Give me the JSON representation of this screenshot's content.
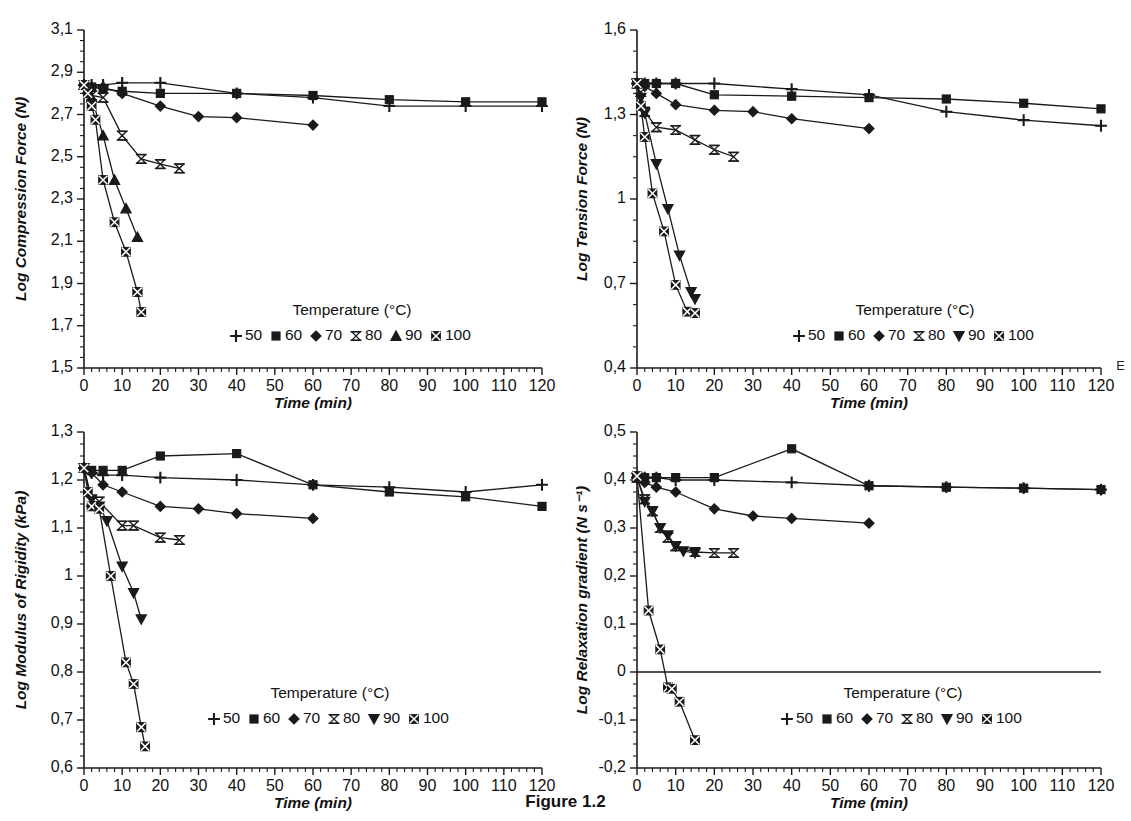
{
  "figure": {
    "caption": "Figure 1.2",
    "edge_artifact": "E"
  },
  "legend": {
    "title": "Temperature (°C)",
    "entries": [
      {
        "label": "50",
        "marker": "plus"
      },
      {
        "label": "60",
        "marker": "square-filled"
      },
      {
        "label": "70",
        "marker": "diamond-filled"
      },
      {
        "label": "80",
        "marker": "bowtie-open"
      },
      {
        "label": "90",
        "marker": "triangle-up-filled"
      },
      {
        "label": "100",
        "marker": "square-crossed"
      }
    ],
    "entries_alt": [
      {
        "label": "50",
        "marker": "plus"
      },
      {
        "label": "60",
        "marker": "square-filled"
      },
      {
        "label": "70",
        "marker": "diamond-filled"
      },
      {
        "label": "80",
        "marker": "bowtie-open"
      },
      {
        "label": "90",
        "marker": "triangle-down-filled"
      },
      {
        "label": "100",
        "marker": "square-crossed"
      }
    ]
  },
  "chart_data": [
    {
      "id": "compression",
      "type": "line",
      "title": "",
      "xlabel": "Time (min)",
      "ylabel": "Log Compression Force (N)",
      "xlim": [
        0,
        120
      ],
      "ylim": [
        1.5,
        3.1
      ],
      "xticks": [
        0,
        10,
        20,
        30,
        40,
        50,
        60,
        70,
        80,
        90,
        100,
        110,
        120
      ],
      "yticks": [
        1.5,
        1.7,
        1.9,
        2.1,
        2.3,
        2.5,
        2.7,
        2.9,
        3.1
      ],
      "ytick_labels": [
        "1,5",
        "1,7",
        "1,9",
        "2,1",
        "2,3",
        "2,5",
        "2,7",
        "2,9",
        "3,1"
      ],
      "xtick_labels": [
        "0",
        "10",
        "20",
        "30",
        "40",
        "50",
        "60",
        "70",
        "80",
        "90",
        "100",
        "110",
        "120"
      ],
      "grid": false,
      "legend_position": "bottom-right",
      "series": [
        {
          "name": "50",
          "marker": "plus",
          "x": [
            0,
            2,
            5,
            10,
            20,
            40,
            60,
            80,
            100,
            120
          ],
          "y": [
            2.84,
            2.84,
            2.84,
            2.85,
            2.85,
            2.8,
            2.78,
            2.74,
            2.74,
            2.74
          ]
        },
        {
          "name": "60",
          "marker": "square-filled",
          "x": [
            0,
            2,
            5,
            10,
            20,
            40,
            60,
            80,
            100,
            120
          ],
          "y": [
            2.84,
            2.83,
            2.82,
            2.81,
            2.8,
            2.8,
            2.79,
            2.77,
            2.76,
            2.76
          ]
        },
        {
          "name": "70",
          "marker": "diamond-filled",
          "x": [
            0,
            2,
            5,
            10,
            20,
            30,
            40,
            60
          ],
          "y": [
            2.84,
            2.83,
            2.83,
            2.8,
            2.74,
            2.69,
            2.685,
            2.65
          ]
        },
        {
          "name": "80",
          "marker": "bowtie-open",
          "x": [
            0,
            1,
            2,
            5,
            10,
            15,
            20,
            25
          ],
          "y": [
            2.84,
            2.82,
            2.79,
            2.78,
            2.6,
            2.49,
            2.465,
            2.445
          ]
        },
        {
          "name": "90",
          "marker": "triangle-up-filled",
          "x": [
            0,
            1,
            2,
            5,
            8,
            11,
            14
          ],
          "y": [
            2.84,
            2.82,
            2.78,
            2.6,
            2.39,
            2.255,
            2.12
          ]
        },
        {
          "name": "100",
          "marker": "square-crossed",
          "x": [
            0,
            1,
            2,
            3,
            5,
            8,
            11,
            14
          ],
          "y": [
            2.84,
            2.8,
            2.74,
            2.675,
            2.39,
            2.19,
            2.05,
            1.86
          ]
        },
        {
          "name": "100b",
          "marker": "square-crossed",
          "x": [
            14,
            15
          ],
          "y": [
            1.86,
            1.765
          ]
        }
      ]
    },
    {
      "id": "tension",
      "type": "line",
      "title": "",
      "xlabel": "Time (min)",
      "ylabel": "Log Tension Force (N)",
      "xlim": [
        0,
        120
      ],
      "ylim": [
        0.4,
        1.6
      ],
      "xticks": [
        0,
        10,
        20,
        30,
        40,
        50,
        60,
        70,
        80,
        90,
        100,
        110,
        120
      ],
      "yticks": [
        0.4,
        0.7,
        1.0,
        1.3,
        1.6
      ],
      "ytick_labels": [
        "0,4",
        "0,7",
        "1",
        "1,3",
        "1,6"
      ],
      "xtick_labels": [
        "0",
        "10",
        "20",
        "30",
        "40",
        "50",
        "60",
        "70",
        "80",
        "90",
        "100",
        "110",
        "120"
      ],
      "grid": false,
      "legend_position": "bottom-right",
      "series": [
        {
          "name": "50",
          "marker": "plus",
          "x": [
            0,
            2,
            5,
            10,
            20,
            40,
            60,
            80,
            100,
            120
          ],
          "y": [
            1.41,
            1.41,
            1.41,
            1.41,
            1.41,
            1.39,
            1.37,
            1.31,
            1.28,
            1.26
          ]
        },
        {
          "name": "60",
          "marker": "square-filled",
          "x": [
            0,
            2,
            5,
            10,
            20,
            40,
            60,
            80,
            100,
            120
          ],
          "y": [
            1.41,
            1.41,
            1.41,
            1.41,
            1.37,
            1.365,
            1.36,
            1.355,
            1.34,
            1.32
          ]
        },
        {
          "name": "70",
          "marker": "diamond-filled",
          "x": [
            0,
            2,
            5,
            10,
            20,
            30,
            40,
            60
          ],
          "y": [
            1.41,
            1.4,
            1.375,
            1.335,
            1.315,
            1.31,
            1.285,
            1.25
          ]
        },
        {
          "name": "80",
          "marker": "bowtie-open",
          "x": [
            0,
            1,
            2,
            5,
            10,
            15,
            20,
            25
          ],
          "y": [
            1.41,
            1.38,
            1.31,
            1.255,
            1.245,
            1.21,
            1.175,
            1.15
          ]
        },
        {
          "name": "90",
          "marker": "triangle-down-filled",
          "x": [
            0,
            1,
            2,
            5,
            8,
            11,
            14,
            15
          ],
          "y": [
            1.41,
            1.36,
            1.305,
            1.125,
            0.965,
            0.8,
            0.67,
            0.645
          ]
        },
        {
          "name": "100",
          "marker": "square-crossed",
          "x": [
            0,
            1,
            2,
            4,
            7,
            10,
            13,
            15
          ],
          "y": [
            1.41,
            1.33,
            1.22,
            1.02,
            0.885,
            0.695,
            0.6,
            0.595
          ]
        }
      ]
    },
    {
      "id": "rigidity",
      "type": "line",
      "title": "",
      "xlabel": "Time (min)",
      "ylabel": "Log Modulus of Rigidity (kPa)",
      "xlim": [
        0,
        120
      ],
      "ylim": [
        0.6,
        1.3
      ],
      "xticks": [
        0,
        10,
        20,
        30,
        40,
        50,
        60,
        70,
        80,
        90,
        100,
        110,
        120
      ],
      "yticks": [
        0.6,
        0.7,
        0.8,
        0.9,
        1.0,
        1.1,
        1.2,
        1.3
      ],
      "ytick_labels": [
        "0,6",
        "0,7",
        "0,8",
        "0,9",
        "1",
        "1,1",
        "1,2",
        "1,3"
      ],
      "xtick_labels": [
        "0",
        "10",
        "20",
        "30",
        "40",
        "50",
        "60",
        "70",
        "80",
        "90",
        "100",
        "110",
        "120"
      ],
      "grid": false,
      "legend_position": "bottom-right",
      "series": [
        {
          "name": "50",
          "marker": "plus",
          "x": [
            0,
            2,
            5,
            10,
            20,
            40,
            60,
            80,
            100,
            120
          ],
          "y": [
            1.225,
            1.215,
            1.21,
            1.21,
            1.205,
            1.2,
            1.19,
            1.185,
            1.175,
            1.19
          ]
        },
        {
          "name": "60",
          "marker": "square-filled",
          "x": [
            0,
            2,
            5,
            10,
            20,
            40,
            60,
            80,
            100,
            120
          ],
          "y": [
            1.225,
            1.22,
            1.22,
            1.22,
            1.25,
            1.255,
            1.19,
            1.175,
            1.165,
            1.145
          ]
        },
        {
          "name": "70",
          "marker": "diamond-filled",
          "x": [
            0,
            2,
            5,
            10,
            20,
            30,
            40,
            60
          ],
          "y": [
            1.225,
            1.215,
            1.19,
            1.175,
            1.145,
            1.14,
            1.13,
            1.12
          ]
        },
        {
          "name": "80",
          "marker": "bowtie-open",
          "x": [
            0,
            2,
            4,
            10,
            13,
            20,
            25
          ],
          "y": [
            1.225,
            1.155,
            1.155,
            1.105,
            1.105,
            1.08,
            1.075
          ]
        },
        {
          "name": "90",
          "marker": "triangle-down-filled",
          "x": [
            0,
            2,
            4,
            6,
            10,
            13,
            15
          ],
          "y": [
            1.225,
            1.16,
            1.145,
            1.115,
            1.02,
            0.965,
            0.91
          ]
        },
        {
          "name": "100",
          "marker": "square-crossed",
          "x": [
            0,
            1,
            2,
            4,
            7,
            11,
            13,
            15
          ],
          "y": [
            1.225,
            1.175,
            1.145,
            1.14,
            1.0,
            0.82,
            0.775,
            0.685
          ]
        },
        {
          "name": "100b",
          "marker": "square-crossed",
          "x": [
            15,
            16
          ],
          "y": [
            0.685,
            0.645
          ]
        }
      ]
    },
    {
      "id": "relaxation",
      "type": "line",
      "title": "",
      "xlabel": "Time (min)",
      "ylabel": "Log Relaxation gradient (N s⁻¹)",
      "xlim": [
        0,
        120
      ],
      "ylim": [
        -0.2,
        0.5
      ],
      "xticks": [
        0,
        10,
        20,
        30,
        40,
        50,
        60,
        70,
        80,
        90,
        100,
        110,
        120
      ],
      "yticks": [
        -0.2,
        -0.1,
        0.0,
        0.1,
        0.2,
        0.3,
        0.4,
        0.5
      ],
      "ytick_labels": [
        "-0,2",
        "-0,1",
        "0",
        "0,1",
        "0,2",
        "0,3",
        "0,4",
        "0,5"
      ],
      "xtick_labels": [
        "0",
        "10",
        "20",
        "30",
        "40",
        "50",
        "60",
        "70",
        "80",
        "90",
        "100",
        "110",
        "120"
      ],
      "grid": false,
      "zero_line": true,
      "legend_position": "bottom-right",
      "series": [
        {
          "name": "50",
          "marker": "plus",
          "x": [
            0,
            2,
            5,
            10,
            20,
            40,
            60,
            80,
            100,
            120
          ],
          "y": [
            0.405,
            0.405,
            0.405,
            0.4,
            0.4,
            0.395,
            0.388,
            0.385,
            0.383,
            0.38
          ]
        },
        {
          "name": "60",
          "marker": "square-filled",
          "x": [
            0,
            2,
            5,
            10,
            20,
            40,
            60,
            80,
            100,
            120
          ],
          "y": [
            0.408,
            0.405,
            0.405,
            0.405,
            0.405,
            0.465,
            0.388,
            0.385,
            0.383,
            0.38
          ]
        },
        {
          "name": "70",
          "marker": "diamond-filled",
          "x": [
            0,
            2,
            5,
            10,
            20,
            30,
            40,
            60
          ],
          "y": [
            0.405,
            0.395,
            0.385,
            0.375,
            0.34,
            0.325,
            0.32,
            0.31
          ]
        },
        {
          "name": "80",
          "marker": "bowtie-open",
          "x": [
            0,
            2,
            4,
            6,
            8,
            10,
            15,
            20,
            25
          ],
          "y": [
            0.405,
            0.36,
            0.335,
            0.3,
            0.28,
            0.262,
            0.25,
            0.248,
            0.248
          ]
        },
        {
          "name": "90",
          "marker": "triangle-down-filled",
          "x": [
            0,
            2,
            4,
            6,
            8,
            10,
            12,
            15
          ],
          "y": [
            0.405,
            0.355,
            0.335,
            0.3,
            0.285,
            0.262,
            0.252,
            0.248
          ]
        },
        {
          "name": "100",
          "marker": "square-crossed",
          "x": [
            0,
            3,
            6,
            8,
            9,
            11,
            15
          ],
          "y": [
            0.408,
            0.128,
            0.047,
            -0.032,
            -0.035,
            -0.062,
            -0.142
          ]
        }
      ]
    }
  ]
}
